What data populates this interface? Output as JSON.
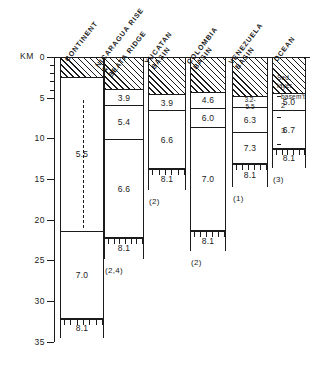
{
  "figure": {
    "axis": {
      "unit_label": "KM",
      "ticks": [
        "0",
        "5",
        "10",
        "15",
        "20",
        "25",
        "30",
        "35"
      ],
      "range_km": [
        0,
        35
      ],
      "direction": "depth-downward"
    },
    "annotations": {
      "sed_layer": "Sed.",
      "sed_layer_2": "layer",
      "basement": "basem't",
      "layer2": "2",
      "layer3": "3"
    }
  },
  "chart_data": {
    "type": "bar",
    "title": "",
    "xlabel": "",
    "ylabel": "KM",
    "ylim": [
      0,
      35
    ],
    "grid": false,
    "legend": "none",
    "units": "seismic P-wave velocity (km/s) vs depth (km)",
    "categories": [
      "CONTINENT",
      "NICARAGUA RISE & BEATA RIDGE",
      "YUCATAN BASIN",
      "COLOMBIA BASIN",
      "VENEZUELA BASIN",
      "OCEAN"
    ],
    "columns": [
      {
        "name": "CONTINENT",
        "header_lines": [
          "CONTINENT"
        ],
        "footnote": "",
        "layers": [
          {
            "velocity": "",
            "top_km": 0.0,
            "bottom_km": 2.6,
            "hatched": true,
            "label": ""
          },
          {
            "velocity": "5.5",
            "top_km": 2.6,
            "bottom_km": 21.5,
            "hatched": false,
            "label": "5.5",
            "dashed_interior": true
          },
          {
            "velocity": "7.0",
            "top_km": 21.5,
            "bottom_km": 32.2,
            "hatched": false,
            "label": "7.0"
          },
          {
            "velocity": "8.1",
            "top_km": 32.2,
            "bottom_km": 34.6,
            "hatched": false,
            "label": "8.1",
            "mantle": true
          }
        ]
      },
      {
        "name": "NICARAGUA RISE & BEATA RIDGE",
        "header_lines": [
          "NICARAGUA RISE",
          "&",
          "BEATA RIDGE"
        ],
        "footnote": "(2,4)",
        "layers": [
          {
            "velocity": "",
            "top_km": 0.0,
            "bottom_km": 4.1,
            "hatched": true,
            "label": ""
          },
          {
            "velocity": "3.9",
            "top_km": 4.1,
            "bottom_km": 6.0,
            "hatched": false,
            "label": "3.9"
          },
          {
            "velocity": "5.4",
            "top_km": 6.0,
            "bottom_km": 10.2,
            "hatched": false,
            "label": "5.4"
          },
          {
            "velocity": "6.6",
            "top_km": 10.2,
            "bottom_km": 22.3,
            "hatched": false,
            "label": "6.6"
          },
          {
            "velocity": "8.1",
            "top_km": 22.3,
            "bottom_km": 24.8,
            "hatched": false,
            "label": "8.1",
            "mantle": true
          }
        ]
      },
      {
        "name": "YUCATAN BASIN",
        "header_lines": [
          "YUCATAN",
          "BASIN"
        ],
        "footnote": "(2)",
        "layers": [
          {
            "velocity": "",
            "top_km": 0.0,
            "bottom_km": 4.7,
            "hatched": true,
            "label": ""
          },
          {
            "velocity": "3.9",
            "top_km": 4.7,
            "bottom_km": 6.7,
            "hatched": false,
            "label": "3.9"
          },
          {
            "velocity": "6.6",
            "top_km": 6.7,
            "bottom_km": 13.8,
            "hatched": false,
            "label": "6.6"
          },
          {
            "velocity": "8.1",
            "top_km": 13.8,
            "bottom_km": 16.3,
            "hatched": false,
            "label": "8.1",
            "mantle": true
          }
        ]
      },
      {
        "name": "COLOMBIA BASIN",
        "header_lines": [
          "COLOMBIA",
          "BASIN"
        ],
        "footnote": "(2)",
        "layers": [
          {
            "velocity": "",
            "top_km": 0.0,
            "bottom_km": 4.4,
            "hatched": true,
            "label": ""
          },
          {
            "velocity": "4.6",
            "top_km": 4.4,
            "bottom_km": 6.4,
            "hatched": false,
            "label": "4.6"
          },
          {
            "velocity": "6.0",
            "top_km": 6.4,
            "bottom_km": 8.7,
            "hatched": false,
            "label": "6.0"
          },
          {
            "velocity": "7.0",
            "top_km": 8.7,
            "bottom_km": 21.4,
            "hatched": false,
            "label": "7.0"
          },
          {
            "velocity": "8.1",
            "top_km": 21.4,
            "bottom_km": 23.9,
            "hatched": false,
            "label": "8.1",
            "mantle": true
          }
        ]
      },
      {
        "name": "VENEZUELA BASIN",
        "header_lines": [
          "VENEZUELA",
          "BASIN"
        ],
        "footnote": "(1)",
        "layers": [
          {
            "velocity": "",
            "top_km": 0.0,
            "bottom_km": 4.9,
            "hatched": true,
            "label": ""
          },
          {
            "velocity": "3.2-5.5",
            "top_km": 4.9,
            "bottom_km": 6.3,
            "hatched": false,
            "label": "3.2-",
            "label2": "5.5"
          },
          {
            "velocity": "6.3",
            "top_km": 6.3,
            "bottom_km": 9.4,
            "hatched": false,
            "label": "6.3"
          },
          {
            "velocity": "7.3",
            "top_km": 9.4,
            "bottom_km": 13.2,
            "hatched": false,
            "label": "7.3"
          },
          {
            "velocity": "8.1",
            "top_km": 13.2,
            "bottom_km": 16.0,
            "hatched": false,
            "label": "8.1",
            "mantle": true
          }
        ]
      },
      {
        "name": "OCEAN",
        "header_lines": [
          "OCEAN"
        ],
        "footnote": "(3)",
        "layers": [
          {
            "velocity": "",
            "top_km": 0.0,
            "bottom_km": 4.6,
            "hatched": true,
            "label": ""
          },
          {
            "velocity": "5.0",
            "top_km": 4.6,
            "bottom_km": 6.7,
            "hatched": false,
            "label": "5.0"
          },
          {
            "velocity": "6.7",
            "top_km": 6.7,
            "bottom_km": 11.3,
            "hatched": false,
            "label": "6.7"
          },
          {
            "velocity": "8.1",
            "top_km": 11.3,
            "bottom_km": 13.7,
            "hatched": false,
            "label": "8.1",
            "mantle": true
          }
        ]
      }
    ]
  }
}
